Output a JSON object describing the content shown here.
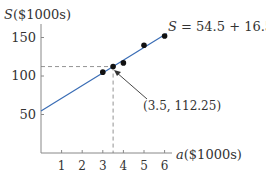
{
  "chart_data": {
    "type": "scatter",
    "title": "",
    "xlabel_var": "a",
    "xlabel_unit": "($1000s)",
    "ylabel_var": "S",
    "ylabel_unit": "($1000s)",
    "x_ticks": [
      1,
      2,
      3,
      4,
      5,
      6
    ],
    "y_ticks": [
      50,
      100,
      150
    ],
    "xlim": [
      0,
      6.3
    ],
    "ylim": [
      0,
      165
    ],
    "grid": false,
    "points": [
      {
        "x": 3,
        "y": 105
      },
      {
        "x": 3.5,
        "y": 112.25
      },
      {
        "x": 4,
        "y": 117
      },
      {
        "x": 5,
        "y": 140
      },
      {
        "x": 6,
        "y": 152
      }
    ],
    "regression_line": {
      "intercept": 54.5,
      "slope": 16.5,
      "label_var": "S",
      "label_eq": " = 54.5 + 16.5",
      "label_var2": "a",
      "color": "#3a6db5"
    },
    "annotation": {
      "text": "(3.5, 112.25)",
      "point": {
        "x": 3.5,
        "y": 112.25
      },
      "dashed_guides": true
    }
  }
}
